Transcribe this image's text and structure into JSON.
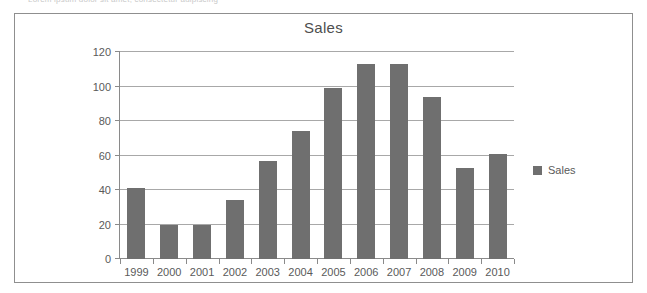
{
  "clipped_caption": "Lorem ipsum dolor sit amet, consectetur adipiscing",
  "frame": {
    "border_color": "#8f8f8f"
  },
  "legend": {
    "label": "Sales",
    "position": "right",
    "swatch_color": "#6f6f6f"
  },
  "chart_data": {
    "type": "bar",
    "title": "Sales",
    "xlabel": "",
    "ylabel": "",
    "categories": [
      "1999",
      "2000",
      "2001",
      "2002",
      "2003",
      "2004",
      "2005",
      "2006",
      "2007",
      "2008",
      "2009",
      "2010"
    ],
    "series": [
      {
        "name": "Sales",
        "color": "#6f6f6f",
        "values": [
          41,
          20,
          20,
          34,
          57,
          74,
          99,
          113,
          113,
          94,
          53,
          61
        ]
      }
    ],
    "ylim": [
      0,
      120
    ],
    "yticks": [
      0,
      20,
      40,
      60,
      80,
      100,
      120
    ],
    "ytick_labels": [
      "0",
      "20",
      "40",
      "60",
      "80",
      "100",
      "120"
    ],
    "grid": true,
    "grid_axis": "y",
    "grid_color": "#a8a8a8",
    "legend_position": "right",
    "legend_entries": [
      "Sales"
    ]
  }
}
